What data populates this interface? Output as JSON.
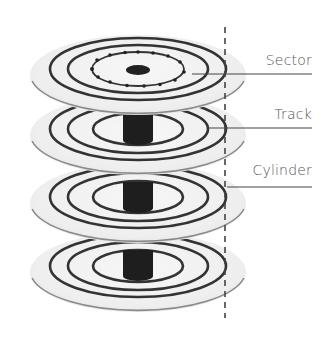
{
  "diagram": {
    "labels": {
      "sector": "Sector",
      "track": "Track",
      "cylinder": "Cylinder"
    },
    "platter_count": 4,
    "colors": {
      "ring": "#333333",
      "disk_fill": "#f3f3f3",
      "disk_edge": "#8a8a8a",
      "spindle": "#1e1e1e",
      "leader_line": "#444444",
      "label_text": "#555555"
    }
  }
}
